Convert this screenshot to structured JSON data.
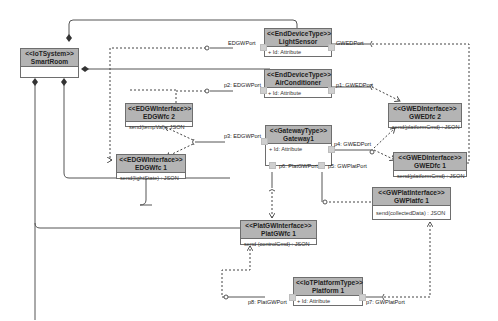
{
  "diagram": {
    "type": "UML composite structure / component diagram",
    "classes": {
      "smartroom": {
        "stereotype": "<<IoTSystem>>",
        "name": "SmartRoom",
        "body": ""
      },
      "lightsensor": {
        "stereotype": "<<EndDeviceType>>",
        "name": "LightSensor",
        "body": "+ Id: Attribute"
      },
      "airconditioner": {
        "stereotype": "<<EndDeviceType>>",
        "name": "AirConditioner",
        "body": "+ Id: Attribute"
      },
      "edgwifc2": {
        "stereotype": "<<EDGWInterface>>",
        "name": "EDGWfc 2",
        "body": "send(tempVal) : JSON"
      },
      "edgwifc1": {
        "stereotype": "<<EDGWInterface>>",
        "name": "EDGWfc 1",
        "body": "send(lightState) : JSON"
      },
      "gateway1": {
        "stereotype": "<<GatewayType>>",
        "name": "Gateway1",
        "body": "+ Id: Attribute"
      },
      "gwedfc2": {
        "stereotype": "<<GWEDInterface>>",
        "name": "GWEDfc 2",
        "body": "send(platformCmd) : JSON"
      },
      "gwedfc1": {
        "stereotype": "<<GWEDInterface>>",
        "name": "GWEDfc 1",
        "body": "send(platformCmd) : JSON"
      },
      "gwplatfc1": {
        "stereotype": "<<GWPlatInterface>>",
        "name": "GWPlatfc 1",
        "body": "send(collectedData) : JSON"
      },
      "platgwfc1": {
        "stereotype": "<<PlatGWInterface>>",
        "name": "PlatGWfc 1",
        "body": "send (controlCmd) : JSON"
      },
      "platform1": {
        "stereotype": "<<IoTPlatformType>>",
        "name": "Platform 1",
        "body": "+ Id: Attribute"
      }
    },
    "port_labels": {
      "ls_edgw": "EDGWPort",
      "ls_gwed": "GWEDPort",
      "ac_edgw": "p2: EDGWPort",
      "ac_gwed": "p1: GWEDPort",
      "gw_edgw": "p3: EDGWPort",
      "gw_gwed": "p4: GWEDPort",
      "gw_platgw": "p6: PlatGWPort",
      "gw_gwplat": "p5: GWPlatPort",
      "pf_platgw": "p8: PlatGWPort",
      "pf_gwplat": "p7: GWPlatPort"
    }
  }
}
